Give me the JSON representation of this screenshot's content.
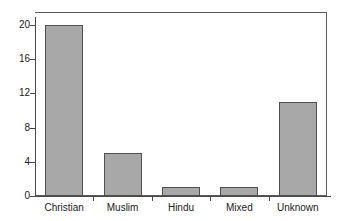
{
  "chart_data": {
    "type": "bar",
    "title": "",
    "subtitle": "",
    "xlabel": "",
    "ylabel": "",
    "categories": [
      "Christian",
      "Muslim",
      "Hindu",
      "Mixed",
      "Unknown"
    ],
    "values": [
      20,
      5,
      1,
      1,
      11
    ],
    "ylim": [
      0,
      21.5
    ],
    "yticks": [
      0,
      4,
      8,
      12,
      16,
      20
    ],
    "ytick_labels": [
      "0",
      "4",
      "8",
      "12",
      "16",
      "20"
    ],
    "grid": true,
    "grid_axis": "y",
    "legend": false,
    "legend_position": "none",
    "orientation": "vertical",
    "bar_color": "#a8a8a8",
    "bar_edge_color": "#4f4f4f",
    "grid_color": "#5a5a5a",
    "axis_color": "#4a4a4a",
    "background": "#ffffff"
  }
}
